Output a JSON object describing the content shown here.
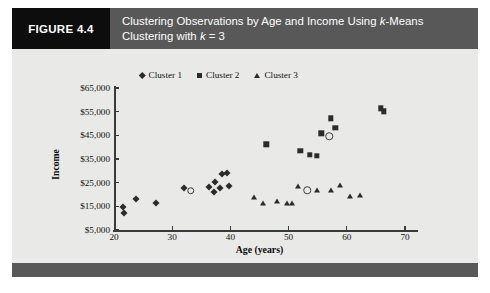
{
  "figure": {
    "tag": "FIGURE 4.4",
    "caption_line1_a": "Clustering Observations by Age and Income Using ",
    "caption_line1_k": "k",
    "caption_line1_b": "-Means",
    "caption_line2_a": "Clustering with ",
    "caption_line2_k": "k",
    "caption_line2_b": " = 3"
  },
  "colors": {
    "header_bar": "#585858",
    "tag_block": "#0d0d0d",
    "panel_background": "#e9e9e7",
    "marker": "#2b2b2b",
    "axis": "#3a3a3a",
    "caption_text": "#ffffff"
  },
  "chart_data": {
    "type": "scatter",
    "title": "Clustering Observations by Age and Income Using k-Means Clustering with k = 3",
    "xlabel": "Age (years)",
    "ylabel": "Income",
    "xlim": [
      20,
      70
    ],
    "ylim": [
      5000,
      65000
    ],
    "xticks": [
      20,
      30,
      40,
      50,
      60,
      70
    ],
    "xtick_labels": [
      "20",
      "30",
      "40",
      "50",
      "60",
      "70"
    ],
    "yticks": [
      5000,
      15000,
      25000,
      35000,
      45000,
      55000,
      65000
    ],
    "ytick_labels": [
      "$5,000",
      "$15,000",
      "$25,000",
      "$35,000",
      "$45,000",
      "$55,000",
      "$65,000"
    ],
    "grid": false,
    "legend_position": "top-center",
    "legend": [
      "Cluster 1",
      "Cluster 2",
      "Cluster 3"
    ],
    "series": [
      {
        "name": "Cluster 1",
        "marker": "diamond",
        "points": [
          [
            21.6,
            14600
          ],
          [
            21.8,
            12100
          ],
          [
            23.8,
            18200
          ],
          [
            27.2,
            16200
          ],
          [
            32.0,
            22800
          ],
          [
            36.4,
            23200
          ],
          [
            37.2,
            21100
          ],
          [
            37.4,
            25400
          ],
          [
            38.2,
            22900
          ],
          [
            38.6,
            28600
          ],
          [
            39.4,
            28900
          ],
          [
            39.8,
            23600
          ]
        ]
      },
      {
        "name": "Cluster 2",
        "marker": "square",
        "points": [
          [
            46.2,
            41200
          ],
          [
            52.0,
            38400
          ],
          [
            53.6,
            36900
          ],
          [
            54.8,
            36400
          ],
          [
            55.6,
            45800
          ],
          [
            57.2,
            52200
          ],
          [
            58.0,
            48200
          ],
          [
            65.8,
            56400
          ],
          [
            66.4,
            55200
          ]
        ]
      },
      {
        "name": "Cluster 3",
        "marker": "triangle",
        "points": [
          [
            44.0,
            19100
          ],
          [
            45.6,
            16200
          ],
          [
            48.0,
            17200
          ],
          [
            49.8,
            16400
          ],
          [
            50.6,
            16400
          ],
          [
            51.6,
            23600
          ],
          [
            54.8,
            22100
          ],
          [
            57.2,
            22100
          ],
          [
            58.8,
            24100
          ],
          [
            60.6,
            19300
          ],
          [
            62.2,
            19900
          ]
        ]
      },
      {
        "name": "Centroids",
        "marker": "open-circle",
        "points": [
          [
            33.2,
            21600
          ],
          [
            53.2,
            21900
          ],
          [
            57.0,
            44600
          ]
        ]
      }
    ]
  }
}
